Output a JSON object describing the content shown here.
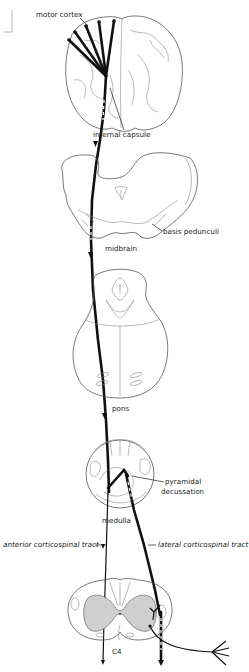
{
  "figure": {
    "labels": {
      "motor_cortex": "motor cortex",
      "internal_capsule": "internal capsule",
      "basis_pedunculi": "basis pedunculi",
      "midbrain": "midbrain",
      "pons": "pons",
      "pyramidal_decussation_line1": "pyramidal",
      "pyramidal_decussation_line2": "decussation",
      "medulla": "medulla",
      "anterior_corticospinal_tract": "anterior corticospinal tract",
      "lateral_corticospinal_tract": "lateral corticospinal tract",
      "spinal_level": "C4"
    },
    "sections": [
      "cerebrum (coronal)",
      "midbrain",
      "pons",
      "medulla",
      "spinal cord C4"
    ],
    "colors": {
      "tract": "#111111",
      "outline": "#555555",
      "gray_matter": "#cfcfcf",
      "background": "#ffffff"
    }
  }
}
